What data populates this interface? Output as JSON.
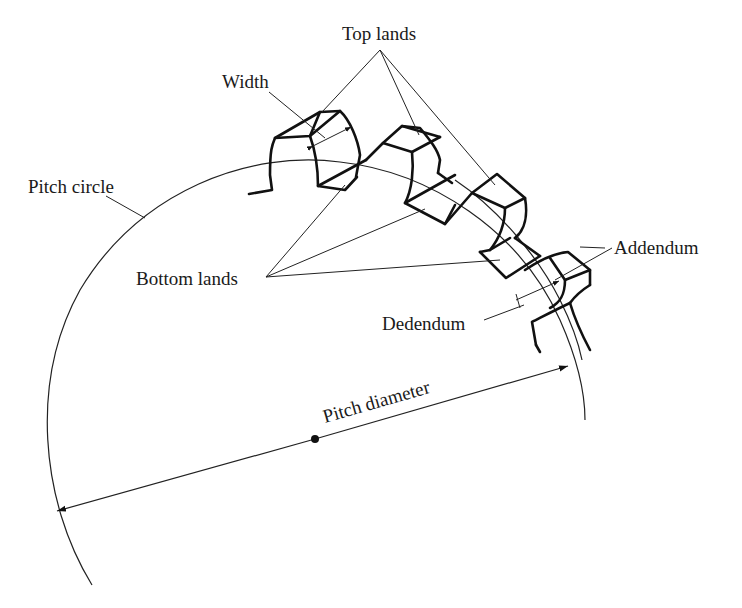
{
  "diagram": {
    "labels": {
      "top_lands": "Top lands",
      "width": "Width",
      "pitch_circle": "Pitch circle",
      "bottom_lands": "Bottom lands",
      "addendum": "Addendum",
      "dedendum": "Dedendum",
      "pitch_diameter": "Pitch diameter"
    },
    "colors": {
      "ink": "#111111",
      "background": "#ffffff"
    }
  }
}
